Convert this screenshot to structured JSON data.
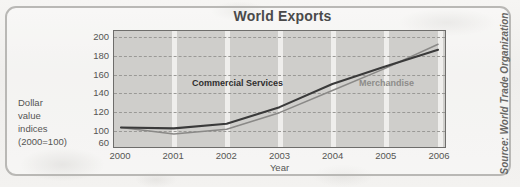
{
  "chart_data": {
    "type": "line",
    "title": "World Exports",
    "xlabel": "Year",
    "ylabel": "Dollar value indices (2000=100)",
    "ylabel_lines": [
      "Dollar",
      "value",
      "indices",
      "(2000=100)"
    ],
    "x": [
      2000,
      2001,
      2002,
      2003,
      2004,
      2005,
      2006
    ],
    "xtick_labels": [
      "2000",
      "2001",
      "2002",
      "2003",
      "2004",
      "2005",
      "2006"
    ],
    "ytick_labels": [
      "200",
      "180",
      "160",
      "140",
      "120",
      "100",
      "60"
    ],
    "ytick_values": [
      200,
      180,
      160,
      140,
      120,
      100,
      60
    ],
    "ylim": [
      60,
      200
    ],
    "xlim": [
      2000,
      2006
    ],
    "grid": "horizontal-dashed-and-vertical-bands",
    "legend_position": "inline-labels",
    "series": [
      {
        "name": "Commercial Services",
        "color": "#3a3a3a",
        "values": [
          102,
          101,
          106,
          124,
          149,
          168,
          186
        ]
      },
      {
        "name": "Merchandise",
        "color": "#8a8987",
        "values": [
          102,
          95,
          100,
          118,
          142,
          166,
          192
        ]
      }
    ],
    "annotations": [
      {
        "text": "Commercial Services",
        "x": 2002.0,
        "y": 146
      },
      {
        "text": "Merchandise",
        "x": 2005.0,
        "y": 146
      }
    ],
    "source": "Source: World Trade Organization"
  },
  "colors": {
    "commercial_services": "#3a3a3a",
    "merchandise": "#8a8987",
    "plot_background": "#cfcecb",
    "axis": "#6e6d6b",
    "gridline": "#9a9996",
    "frame": "#b9b8b5",
    "title_text": "#4a4a4a",
    "tick_text": "#555553"
  }
}
